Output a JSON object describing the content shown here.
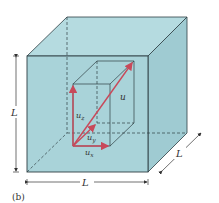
{
  "figure": {
    "caption": "(b)",
    "colors": {
      "cube_fill": "#a9d3d9",
      "cube_fill_top": "#b5dbe0",
      "cube_fill_side": "#9fcbd2",
      "edge": "#2f3f44",
      "vector": "#c8495a"
    },
    "outer_cube": {
      "label_height": "L",
      "label_width": "L",
      "label_depth": "L"
    },
    "vectors": {
      "u": "u",
      "ux": {
        "base": "u",
        "sub": "x"
      },
      "uy": {
        "base": "u",
        "sub": "y"
      },
      "uz": {
        "base": "u",
        "sub": "z"
      }
    }
  }
}
